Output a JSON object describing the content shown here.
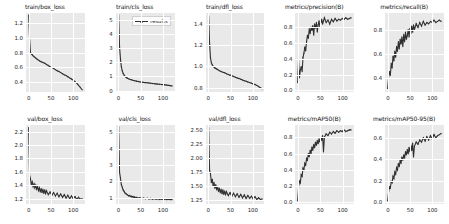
{
  "figure": {
    "title": "",
    "series_color": "#303030",
    "panel_bg": "#e9e9e9",
    "grid_color": "#ffffff",
    "legend": {
      "label": "results",
      "marker": "line-with-dot"
    }
  },
  "chart_data": [
    {
      "type": "line",
      "title": "train/box_loss",
      "xlabel": "",
      "ylabel": "",
      "xticks": [
        0,
        50,
        100
      ],
      "yticks": [
        0.4,
        0.6,
        0.8,
        1.0,
        1.2
      ],
      "xlim": [
        -6,
        126
      ],
      "ylim": [
        0.27,
        1.33
      ],
      "grid": true,
      "legend_position": "none",
      "series": [
        {
          "name": "results",
          "x": [
            0,
            2,
            4,
            6,
            8,
            10,
            12,
            14,
            16,
            18,
            20,
            24,
            28,
            32,
            36,
            40,
            44,
            48,
            52,
            56,
            60,
            64,
            68,
            72,
            76,
            80,
            84,
            88,
            92,
            96,
            100,
            104,
            108,
            112,
            116,
            120
          ],
          "values": [
            1.3,
            0.99,
            0.8,
            0.78,
            0.77,
            0.755,
            0.745,
            0.735,
            0.725,
            0.715,
            0.705,
            0.69,
            0.675,
            0.665,
            0.655,
            0.64,
            0.625,
            0.61,
            0.6,
            0.585,
            0.57,
            0.555,
            0.545,
            0.53,
            0.515,
            0.5,
            0.49,
            0.475,
            0.46,
            0.445,
            0.43,
            0.41,
            0.39,
            0.36,
            0.33,
            0.3
          ]
        }
      ]
    },
    {
      "type": "line",
      "title": "train/cls_loss",
      "xlabel": "",
      "ylabel": "",
      "xticks": [
        0,
        50,
        100
      ],
      "yticks": [
        0,
        1,
        2,
        3,
        4,
        5
      ],
      "xlim": [
        -6,
        126
      ],
      "ylim": [
        -0.1,
        5.5
      ],
      "grid": true,
      "legend_position": "upper right",
      "series": [
        {
          "name": "results",
          "x": [
            0,
            2,
            4,
            6,
            8,
            10,
            12,
            14,
            16,
            18,
            20,
            24,
            28,
            32,
            36,
            40,
            44,
            48,
            52,
            56,
            60,
            64,
            68,
            72,
            76,
            80,
            84,
            88,
            92,
            96,
            100,
            104,
            108,
            112,
            116,
            120
          ],
          "values": [
            5.4,
            3.1,
            2.25,
            1.7,
            1.4,
            1.22,
            1.1,
            1.02,
            0.96,
            0.91,
            0.87,
            0.81,
            0.77,
            0.73,
            0.7,
            0.67,
            0.645,
            0.62,
            0.6,
            0.58,
            0.565,
            0.55,
            0.535,
            0.52,
            0.505,
            0.49,
            0.475,
            0.46,
            0.45,
            0.435,
            0.42,
            0.405,
            0.39,
            0.37,
            0.35,
            0.33
          ]
        }
      ]
    },
    {
      "type": "line",
      "title": "train/dfl_loss",
      "xlabel": "",
      "ylabel": "",
      "xticks": [
        0,
        50,
        100
      ],
      "yticks": [
        0.8,
        1.0,
        1.2,
        1.4
      ],
      "xlim": [
        -6,
        126
      ],
      "ylim": [
        0.76,
        1.5
      ],
      "grid": true,
      "legend_position": "none",
      "series": [
        {
          "name": "results",
          "x": [
            0,
            2,
            4,
            6,
            8,
            10,
            12,
            14,
            16,
            18,
            20,
            24,
            28,
            32,
            36,
            40,
            44,
            48,
            52,
            56,
            60,
            64,
            68,
            72,
            76,
            80,
            84,
            88,
            92,
            96,
            100,
            104,
            108,
            112,
            116,
            120
          ],
          "values": [
            1.47,
            1.22,
            1.08,
            1.035,
            1.015,
            1.0,
            0.995,
            0.985,
            0.98,
            0.975,
            0.97,
            0.96,
            0.952,
            0.945,
            0.94,
            0.932,
            0.925,
            0.918,
            0.912,
            0.905,
            0.898,
            0.892,
            0.886,
            0.88,
            0.873,
            0.866,
            0.86,
            0.854,
            0.848,
            0.842,
            0.836,
            0.83,
            0.822,
            0.812,
            0.8,
            0.79
          ]
        }
      ]
    },
    {
      "type": "line",
      "title": "metrics/precision(B)",
      "xlabel": "",
      "ylabel": "",
      "xticks": [
        0,
        50,
        100
      ],
      "yticks": [
        0.0,
        0.2,
        0.4,
        0.6,
        0.8
      ],
      "xlim": [
        -6,
        126
      ],
      "ylim": [
        -0.02,
        0.98
      ],
      "grid": true,
      "legend_position": "none",
      "series": [
        {
          "name": "results",
          "x": [
            0,
            2,
            4,
            6,
            8,
            10,
            12,
            14,
            16,
            18,
            20,
            22,
            24,
            26,
            28,
            30,
            32,
            34,
            36,
            38,
            40,
            42,
            44,
            46,
            48,
            50,
            52,
            54,
            56,
            58,
            60,
            64,
            68,
            72,
            76,
            80,
            84,
            88,
            92,
            96,
            100,
            104,
            108,
            112,
            116,
            120
          ],
          "values": [
            0.1,
            0.38,
            0.16,
            0.26,
            0.3,
            0.24,
            0.42,
            0.47,
            0.55,
            0.5,
            0.62,
            0.7,
            0.66,
            0.78,
            0.72,
            0.8,
            0.76,
            0.82,
            0.7,
            0.84,
            0.79,
            0.86,
            0.74,
            0.83,
            0.88,
            0.8,
            0.86,
            0.9,
            0.84,
            0.88,
            0.92,
            0.86,
            0.89,
            0.84,
            0.9,
            0.87,
            0.91,
            0.88,
            0.9,
            0.89,
            0.91,
            0.9,
            0.92,
            0.9,
            0.91,
            0.92
          ]
        }
      ]
    },
    {
      "type": "line",
      "title": "metrics/recall(B)",
      "xlabel": "",
      "ylabel": "",
      "xticks": [
        0,
        50,
        100
      ],
      "yticks": [
        0.4,
        0.6,
        0.8
      ],
      "xlim": [
        -6,
        126
      ],
      "ylim": [
        0.28,
        0.94
      ],
      "grid": true,
      "legend_position": "none",
      "series": [
        {
          "name": "results",
          "x": [
            0,
            2,
            4,
            6,
            8,
            10,
            12,
            14,
            16,
            18,
            20,
            22,
            24,
            26,
            28,
            30,
            32,
            34,
            36,
            38,
            40,
            42,
            44,
            46,
            48,
            50,
            52,
            54,
            56,
            58,
            60,
            64,
            68,
            72,
            76,
            80,
            84,
            88,
            92,
            96,
            100,
            104,
            108,
            112,
            116,
            120
          ],
          "values": [
            0.31,
            0.4,
            0.45,
            0.42,
            0.52,
            0.48,
            0.58,
            0.54,
            0.62,
            0.57,
            0.66,
            0.62,
            0.7,
            0.64,
            0.72,
            0.68,
            0.74,
            0.66,
            0.76,
            0.7,
            0.78,
            0.72,
            0.75,
            0.8,
            0.74,
            0.81,
            0.77,
            0.83,
            0.78,
            0.84,
            0.8,
            0.85,
            0.82,
            0.86,
            0.83,
            0.87,
            0.84,
            0.86,
            0.85,
            0.87,
            0.86,
            0.88,
            0.86,
            0.87,
            0.88,
            0.87
          ]
        }
      ]
    },
    {
      "type": "line",
      "title": "val/box_loss",
      "xlabel": "",
      "ylabel": "",
      "xticks": [
        0,
        50,
        100
      ],
      "yticks": [
        1.2,
        1.4,
        1.6,
        1.8,
        2.0,
        2.2
      ],
      "xlim": [
        -6,
        126
      ],
      "ylim": [
        1.12,
        2.3
      ],
      "grid": true,
      "legend_position": "none",
      "series": [
        {
          "name": "results",
          "x": [
            0,
            2,
            4,
            6,
            8,
            10,
            12,
            14,
            16,
            18,
            20,
            22,
            24,
            26,
            28,
            30,
            32,
            34,
            36,
            38,
            40,
            44,
            48,
            52,
            56,
            60,
            64,
            68,
            72,
            76,
            80,
            84,
            88,
            92,
            96,
            100,
            104,
            108,
            112,
            116,
            120
          ],
          "values": [
            2.26,
            1.55,
            1.5,
            1.41,
            1.45,
            1.38,
            1.42,
            1.36,
            1.4,
            1.34,
            1.38,
            1.32,
            1.36,
            1.3,
            1.35,
            1.29,
            1.34,
            1.28,
            1.33,
            1.27,
            1.32,
            1.26,
            1.3,
            1.25,
            1.29,
            1.24,
            1.28,
            1.23,
            1.27,
            1.22,
            1.26,
            1.21,
            1.25,
            1.2,
            1.24,
            1.2,
            1.23,
            1.19,
            1.22,
            1.19,
            1.2
          ]
        }
      ]
    },
    {
      "type": "line",
      "title": "val/cls_loss",
      "xlabel": "",
      "ylabel": "",
      "xticks": [
        0,
        50,
        100
      ],
      "yticks": [
        1,
        2,
        3,
        4,
        5
      ],
      "xlim": [
        -6,
        126
      ],
      "ylim": [
        0.62,
        5.45
      ],
      "grid": true,
      "legend_position": "none",
      "series": [
        {
          "name": "results",
          "x": [
            0,
            2,
            4,
            6,
            8,
            10,
            12,
            14,
            16,
            18,
            20,
            22,
            24,
            26,
            28,
            30,
            32,
            34,
            36,
            38,
            40,
            44,
            48,
            52,
            56,
            60,
            64,
            68,
            72,
            76,
            80,
            84,
            88,
            92,
            96,
            100,
            104,
            108,
            112,
            116,
            120
          ],
          "values": [
            5.35,
            2.55,
            2.2,
            1.8,
            1.65,
            1.48,
            1.4,
            1.3,
            1.26,
            1.2,
            1.18,
            1.12,
            1.14,
            1.08,
            1.1,
            1.05,
            1.08,
            1.02,
            1.05,
            1.0,
            1.02,
            0.98,
            1.0,
            0.95,
            0.98,
            0.94,
            0.97,
            0.93,
            0.96,
            0.92,
            0.95,
            0.91,
            0.94,
            0.9,
            0.93,
            0.9,
            0.92,
            0.89,
            0.91,
            0.89,
            0.9
          ]
        }
      ]
    },
    {
      "type": "line",
      "title": "val/dfl_loss",
      "xlabel": "",
      "ylabel": "",
      "xticks": [
        0,
        50,
        100
      ],
      "yticks": [
        1.25,
        1.5,
        1.75,
        2.0,
        2.25,
        2.5
      ],
      "xlim": [
        -6,
        126
      ],
      "ylim": [
        1.18,
        2.58
      ],
      "grid": true,
      "legend_position": "none",
      "series": [
        {
          "name": "results",
          "x": [
            0,
            2,
            4,
            6,
            8,
            10,
            12,
            14,
            16,
            18,
            20,
            22,
            24,
            26,
            28,
            30,
            32,
            34,
            36,
            38,
            40,
            44,
            48,
            52,
            56,
            60,
            64,
            68,
            72,
            76,
            80,
            84,
            88,
            92,
            96,
            100,
            104,
            108,
            112,
            116,
            120
          ],
          "values": [
            2.53,
            1.78,
            1.72,
            1.56,
            1.62,
            1.5,
            1.56,
            1.46,
            1.52,
            1.43,
            1.49,
            1.4,
            1.46,
            1.38,
            1.44,
            1.36,
            1.43,
            1.35,
            1.41,
            1.34,
            1.4,
            1.33,
            1.38,
            1.32,
            1.37,
            1.31,
            1.36,
            1.3,
            1.35,
            1.29,
            1.34,
            1.28,
            1.33,
            1.28,
            1.32,
            1.27,
            1.31,
            1.26,
            1.29,
            1.26,
            1.27
          ]
        }
      ]
    },
    {
      "type": "line",
      "title": "metrics/mAP50(B)",
      "xlabel": "",
      "ylabel": "",
      "xticks": [
        0,
        50,
        100
      ],
      "yticks": [
        0.0,
        0.2,
        0.4,
        0.6,
        0.8
      ],
      "xlim": [
        -6,
        126
      ],
      "ylim": [
        -0.02,
        0.95
      ],
      "grid": true,
      "legend_position": "none",
      "series": [
        {
          "name": "results",
          "x": [
            0,
            2,
            4,
            6,
            8,
            10,
            12,
            14,
            16,
            18,
            20,
            22,
            24,
            26,
            28,
            30,
            32,
            34,
            36,
            38,
            40,
            42,
            44,
            46,
            48,
            50,
            52,
            54,
            56,
            58,
            60,
            64,
            68,
            72,
            76,
            80,
            84,
            88,
            92,
            96,
            100,
            104,
            108,
            112,
            116,
            120
          ],
          "values": [
            0.02,
            0.18,
            0.26,
            0.24,
            0.34,
            0.32,
            0.42,
            0.4,
            0.48,
            0.46,
            0.54,
            0.52,
            0.6,
            0.56,
            0.64,
            0.6,
            0.68,
            0.64,
            0.71,
            0.67,
            0.74,
            0.7,
            0.76,
            0.72,
            0.78,
            0.74,
            0.8,
            0.76,
            0.82,
            0.62,
            0.8,
            0.84,
            0.82,
            0.86,
            0.84,
            0.87,
            0.85,
            0.88,
            0.86,
            0.88,
            0.87,
            0.89,
            0.87,
            0.88,
            0.89,
            0.89
          ]
        }
      ]
    },
    {
      "type": "line",
      "title": "metrics/mAP50-95(B)",
      "xlabel": "",
      "ylabel": "",
      "xticks": [
        0,
        50,
        100
      ],
      "yticks": [
        0.0,
        0.2,
        0.4,
        0.6
      ],
      "xlim": [
        -6,
        126
      ],
      "ylim": [
        -0.02,
        0.72
      ],
      "grid": true,
      "legend_position": "none",
      "series": [
        {
          "name": "results",
          "x": [
            0,
            2,
            4,
            6,
            8,
            10,
            12,
            14,
            16,
            18,
            20,
            22,
            24,
            26,
            28,
            30,
            32,
            34,
            36,
            38,
            40,
            42,
            44,
            46,
            48,
            50,
            52,
            54,
            56,
            58,
            60,
            64,
            68,
            72,
            76,
            80,
            84,
            88,
            92,
            96,
            100,
            104,
            108,
            112,
            116,
            120
          ],
          "values": [
            0.01,
            0.09,
            0.14,
            0.13,
            0.19,
            0.18,
            0.24,
            0.22,
            0.28,
            0.26,
            0.32,
            0.3,
            0.36,
            0.33,
            0.39,
            0.36,
            0.42,
            0.39,
            0.44,
            0.41,
            0.47,
            0.44,
            0.49,
            0.45,
            0.51,
            0.47,
            0.53,
            0.48,
            0.55,
            0.42,
            0.52,
            0.56,
            0.54,
            0.58,
            0.56,
            0.6,
            0.57,
            0.61,
            0.58,
            0.62,
            0.59,
            0.63,
            0.6,
            0.62,
            0.63,
            0.64
          ]
        }
      ]
    }
  ]
}
